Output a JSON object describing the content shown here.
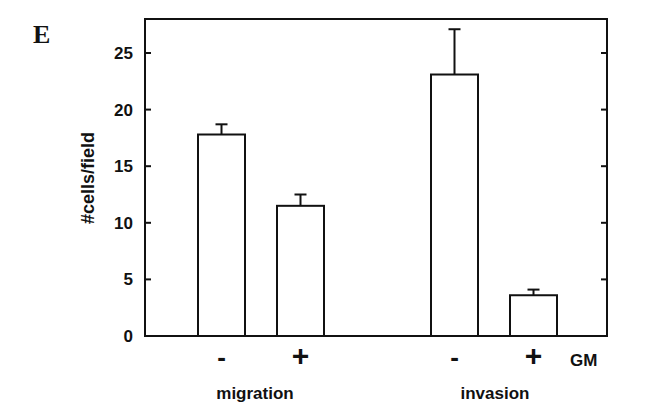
{
  "panel_label": "E",
  "chart_data": {
    "type": "bar",
    "title": "",
    "ylabel": "#cells/field",
    "xlabel": "",
    "ylim": [
      0,
      28
    ],
    "yticks": [
      0,
      5,
      10,
      15,
      20,
      25
    ],
    "groups": [
      "migration",
      "invasion"
    ],
    "categories": [
      "-",
      "+",
      "-",
      "+"
    ],
    "treatment_label": "GM",
    "values": [
      17.8,
      11.5,
      23.1,
      3.6
    ],
    "errors": [
      0.9,
      1.0,
      4.0,
      0.5
    ],
    "bar_fill": "#ffffff",
    "bar_stroke": "#111111",
    "grid": false,
    "legend": null
  }
}
